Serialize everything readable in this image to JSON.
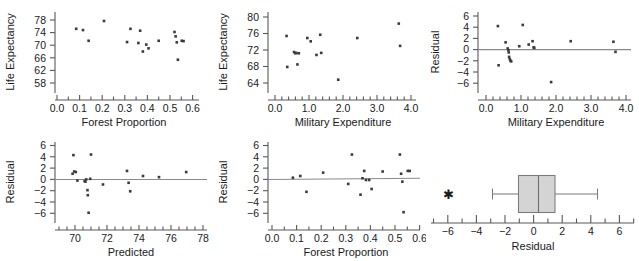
{
  "figure": {
    "type": "regression-diagnostics-panel",
    "rows": 2,
    "cols": 3,
    "point_color": "#3b3b3b",
    "axis_color": "#595959",
    "reference_line_color": "#8a8a8a"
  },
  "chart_data": [
    {
      "id": "panel-forest-vs-life",
      "type": "scatter",
      "title": "",
      "xlabel": "Forest Proportion",
      "ylabel": "Life Expectancy",
      "xlim": [
        0.0,
        0.635
      ],
      "ylim": [
        56.5,
        79.5
      ],
      "xticks": [
        0.0,
        0.1,
        0.2,
        0.3,
        0.4,
        0.5,
        0.6
      ],
      "xtick_labels": [
        "0.0",
        "0.1",
        "0.2",
        "0.3",
        "0.4",
        "0.5",
        "0.6"
      ],
      "yticks": [
        58,
        62,
        66,
        70,
        74,
        78
      ],
      "ytick_labels": [
        "58",
        "62",
        "66",
        "70",
        "74",
        "78"
      ],
      "minor_xticks": [
        0.05,
        0.15,
        0.25,
        0.35,
        0.45,
        0.55
      ],
      "grid": false,
      "x": [
        0.085,
        0.115,
        0.14,
        0.208,
        0.31,
        0.325,
        0.36,
        0.368,
        0.38,
        0.395,
        0.405,
        0.45,
        0.52,
        0.525,
        0.53,
        0.535,
        0.552,
        0.56
      ],
      "y": [
        75.2,
        74.8,
        71.4,
        77.7,
        71.0,
        75.2,
        70.7,
        74.6,
        68.0,
        70.2,
        69.0,
        71.4,
        74.2,
        72.8,
        70.9,
        65.4,
        71.4,
        71.3
      ]
    },
    {
      "id": "panel-military-vs-life",
      "type": "scatter",
      "title": "",
      "xlabel": "Military Expenditure",
      "ylabel": "Life Expectancy",
      "xlim": [
        -0.12,
        4.3
      ],
      "ylim": [
        62.6,
        81.0
      ],
      "xticks": [
        0.0,
        1.0,
        2.0,
        3.0,
        4.0
      ],
      "xtick_labels": [
        "0.0",
        "1.0",
        "2.0",
        "3.0",
        "4.0"
      ],
      "yticks": [
        64,
        68,
        72,
        76,
        80
      ],
      "ytick_labels": [
        "64",
        "68",
        "72",
        "76",
        "80"
      ],
      "minor_xticks": [
        0.2,
        0.4,
        0.6,
        0.8,
        1.2,
        1.4,
        1.6,
        1.8,
        2.2,
        2.4,
        2.6,
        2.8,
        3.2,
        3.4,
        3.6,
        3.8
      ],
      "grid": false,
      "x": [
        0.34,
        0.36,
        0.56,
        0.6,
        0.63,
        0.66,
        0.7,
        0.95,
        1.05,
        1.22,
        1.33,
        1.36,
        1.86,
        2.42,
        3.64,
        3.68
      ],
      "y": [
        75.4,
        67.9,
        71.5,
        71.2,
        71.3,
        68.5,
        71.2,
        74.9,
        74.1,
        70.8,
        75.7,
        71.3,
        64.8,
        74.9,
        78.4,
        73.0
      ]
    },
    {
      "id": "panel-residual-vs-military",
      "type": "scatter",
      "title": "",
      "xlabel": "Military Expenditure",
      "ylabel": "Residual",
      "xlim": [
        -0.12,
        4.3
      ],
      "ylim": [
        -7.2,
        7.2
      ],
      "xticks": [
        0.0,
        1.0,
        2.0,
        3.0,
        4.0
      ],
      "xtick_labels": [
        "0.0",
        "1.0",
        "2.0",
        "3.0",
        "4.0"
      ],
      "yticks": [
        -6,
        -4,
        -2,
        0,
        2,
        4,
        6
      ],
      "ytick_labels": [
        "−6",
        "−4",
        "−2",
        "0",
        "2",
        "4",
        "6"
      ],
      "minor_xticks": [
        0.2,
        0.4,
        0.6,
        0.8,
        1.2,
        1.4,
        1.6,
        1.8,
        2.2,
        2.4,
        2.6,
        2.8,
        3.2,
        3.4,
        3.6,
        3.8
      ],
      "reference_line_y": 0,
      "grid": false,
      "x": [
        0.34,
        0.36,
        0.56,
        0.62,
        0.64,
        0.65,
        0.66,
        0.68,
        0.7,
        0.72,
        0.95,
        1.05,
        1.22,
        1.33,
        1.36,
        1.38,
        1.86,
        2.42,
        3.64,
        3.7
      ],
      "y": [
        4.2,
        -2.8,
        1.3,
        0.2,
        -0.1,
        -0.5,
        -1.3,
        -1.7,
        -2.0,
        -2.1,
        0.6,
        4.4,
        0.9,
        1.5,
        0.4,
        0.3,
        -5.8,
        1.5,
        1.4,
        -0.4
      ]
    },
    {
      "id": "panel-residual-vs-predicted",
      "type": "scatter",
      "title": "",
      "xlabel": "Predicted",
      "ylabel": "Residual",
      "xlim": [
        68.9,
        78.3
      ],
      "ylim": [
        -7.2,
        7.2
      ],
      "xticks": [
        70,
        72,
        74,
        76,
        78
      ],
      "xtick_labels": [
        "70",
        "72",
        "74",
        "76",
        "78"
      ],
      "yticks": [
        -6,
        -4,
        -2,
        0,
        2,
        4,
        6
      ],
      "ytick_labels": [
        "−6",
        "−4",
        "−2",
        "0",
        "2",
        "4",
        "6"
      ],
      "minor_xticks": [
        69.5,
        70.5,
        71.0,
        71.5,
        72.5,
        73.0,
        73.5,
        74.5,
        75.0,
        75.5,
        76.5,
        77.0,
        77.5
      ],
      "reference_line_y": 0,
      "grid": false,
      "x": [
        69.85,
        69.9,
        69.95,
        70.05,
        70.15,
        70.6,
        70.65,
        70.7,
        70.78,
        70.8,
        70.85,
        70.95,
        71.0,
        71.75,
        73.25,
        73.35,
        73.45,
        74.25,
        75.25,
        76.95
      ],
      "y": [
        1.0,
        4.3,
        1.4,
        1.3,
        -0.2,
        -0.3,
        -0.4,
        0.0,
        -1.9,
        -2.8,
        -5.9,
        0.1,
        4.4,
        -0.9,
        1.5,
        -0.6,
        -2.1,
        0.6,
        0.4,
        1.3
      ]
    },
    {
      "id": "panel-residual-vs-forest",
      "type": "scatter",
      "title": "",
      "xlabel": "Forest Proportion",
      "ylabel": "Residual",
      "xlim": [
        -0.015,
        0.625
      ],
      "ylim": [
        -7.2,
        7.2
      ],
      "xticks": [
        0.0,
        0.1,
        0.2,
        0.3,
        0.4,
        0.5,
        0.6
      ],
      "xtick_labels": [
        "0.0",
        "0.1",
        "0.2",
        "0.3",
        "0.4",
        "0.5",
        "0.6"
      ],
      "yticks": [
        -6,
        -4,
        -2,
        0,
        2,
        4,
        6
      ],
      "ytick_labels": [
        "−6",
        "−4",
        "−2",
        "0",
        "2",
        "4",
        "6"
      ],
      "minor_xticks": [
        0.05,
        0.15,
        0.25,
        0.35,
        0.45,
        0.55
      ],
      "reference_line_y": 0,
      "grid": false,
      "x": [
        0.085,
        0.115,
        0.14,
        0.208,
        0.31,
        0.325,
        0.36,
        0.368,
        0.375,
        0.382,
        0.395,
        0.405,
        0.45,
        0.52,
        0.525,
        0.53,
        0.535,
        0.552,
        0.56
      ],
      "y": [
        0.3,
        0.6,
        -2.2,
        1.2,
        -0.8,
        4.4,
        -2.7,
        0.2,
        1.5,
        -0.1,
        -0.1,
        -1.7,
        1.4,
        4.4,
        1.0,
        -0.4,
        -5.8,
        1.5,
        1.5
      ]
    },
    {
      "id": "panel-residual-boxplot",
      "type": "boxplot",
      "title": "",
      "xlabel": "Residual",
      "ylabel": "",
      "xlim": [
        -7.3,
        7.3
      ],
      "xticks": [
        -6,
        -4,
        -2,
        0,
        2,
        4,
        6
      ],
      "xtick_labels": [
        "−6",
        "−4",
        "−2",
        "0",
        "2",
        "4",
        "6"
      ],
      "minor_xticks": [
        -7,
        -5,
        -3,
        -1,
        1,
        3,
        5,
        7
      ],
      "grid": false,
      "box": {
        "whisker_low": -2.2,
        "q1": -0.9,
        "median": 0.35,
        "q3": 1.4,
        "whisker_high": 4.4,
        "outliers": [
          -5.85
        ]
      },
      "outlier_marker": "asterisk"
    }
  ]
}
